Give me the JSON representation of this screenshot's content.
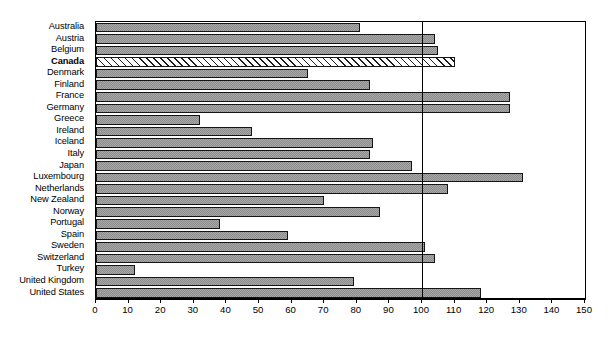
{
  "chart_data": {
    "type": "bar",
    "orientation": "horizontal",
    "title": "",
    "xlabel": "",
    "ylabel": "",
    "xlim": [
      0,
      150
    ],
    "xticks": [
      0,
      10,
      20,
      30,
      40,
      50,
      60,
      70,
      80,
      90,
      100,
      110,
      120,
      130,
      140,
      150
    ],
    "grid": false,
    "legend": null,
    "reference_line": 100,
    "highlight_category": "Canada",
    "categories": [
      "Australia",
      "Austria",
      "Belgium",
      "Canada",
      "Denmark",
      "Finland",
      "France",
      "Germany",
      "Greece",
      "Ireland",
      "Iceland",
      "Italy",
      "Japan",
      "Luxembourg",
      "Netherlands",
      "New Zealand",
      "Norway",
      "Portugal",
      "Spain",
      "Sweden",
      "Switzerland",
      "Turkey",
      "United Kingdom",
      "United States"
    ],
    "values": [
      81,
      104,
      105,
      110,
      65,
      84,
      127,
      127,
      32,
      48,
      85,
      84,
      97,
      131,
      108,
      70,
      87,
      38,
      59,
      101,
      104,
      12,
      79,
      118
    ],
    "bars": [
      {
        "label": "Australia",
        "value": 81,
        "style": "shaded"
      },
      {
        "label": "Austria",
        "value": 104,
        "style": "shaded"
      },
      {
        "label": "Belgium",
        "value": 105,
        "style": "shaded"
      },
      {
        "label": "Canada",
        "value": 110,
        "style": "hatched"
      },
      {
        "label": "Denmark",
        "value": 65,
        "style": "shaded"
      },
      {
        "label": "Finland",
        "value": 84,
        "style": "shaded"
      },
      {
        "label": "France",
        "value": 127,
        "style": "shaded"
      },
      {
        "label": "Germany",
        "value": 127,
        "style": "shaded"
      },
      {
        "label": "Greece",
        "value": 32,
        "style": "shaded"
      },
      {
        "label": "Ireland",
        "value": 48,
        "style": "shaded"
      },
      {
        "label": "Iceland",
        "value": 85,
        "style": "shaded"
      },
      {
        "label": "Italy",
        "value": 84,
        "style": "shaded"
      },
      {
        "label": "Japan",
        "value": 97,
        "style": "shaded"
      },
      {
        "label": "Luxembourg",
        "value": 131,
        "style": "shaded"
      },
      {
        "label": "Netherlands",
        "value": 108,
        "style": "shaded"
      },
      {
        "label": "New Zealand",
        "value": 70,
        "style": "shaded"
      },
      {
        "label": "Norway",
        "value": 87,
        "style": "shaded"
      },
      {
        "label": "Portugal",
        "value": 38,
        "style": "shaded"
      },
      {
        "label": "Spain",
        "value": 59,
        "style": "shaded"
      },
      {
        "label": "Sweden",
        "value": 101,
        "style": "shaded"
      },
      {
        "label": "Switzerland",
        "value": 104,
        "style": "shaded"
      },
      {
        "label": "Turkey",
        "value": 12,
        "style": "shaded"
      },
      {
        "label": "United Kingdom",
        "value": 79,
        "style": "shaded"
      },
      {
        "label": "United States",
        "value": 118,
        "style": "shaded"
      }
    ],
    "colors": {
      "bar_fill": "#a8a8a8",
      "bar_border": "#151515",
      "highlight_fill": "#ffffff",
      "axis": "#000000",
      "reference_line": "#000000",
      "background": "#ffffff"
    }
  }
}
